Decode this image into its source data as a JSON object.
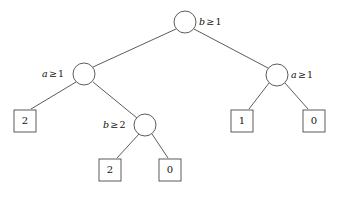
{
  "diagram": {
    "type": "decision-tree",
    "title": "",
    "stroke_color": "#4a4a4a",
    "text_color": "#111111",
    "background": "#ffffff",
    "nodes": [
      {
        "id": "root",
        "shape": "circle",
        "variable": "b",
        "operator": "≥",
        "threshold": "1",
        "label": "b ≥ 1",
        "label_side": "right",
        "cx": 185,
        "cy": 22,
        "r": 11
      },
      {
        "id": "left",
        "shape": "circle",
        "variable": "a",
        "operator": "≥",
        "threshold": "1",
        "label": "a ≥ 1",
        "label_side": "left",
        "cx": 84,
        "cy": 74,
        "r": 11
      },
      {
        "id": "right",
        "shape": "circle",
        "variable": "a",
        "operator": "≥",
        "threshold": "1",
        "label": "a ≥ 1",
        "label_side": "right",
        "cx": 277,
        "cy": 75,
        "r": 11
      },
      {
        "id": "mid",
        "shape": "circle",
        "variable": "b",
        "operator": "≥",
        "threshold": "2",
        "label": "b ≥ 2",
        "label_side": "left",
        "cx": 145,
        "cy": 125,
        "r": 11
      }
    ],
    "leaves": [
      {
        "id": "leaf-left",
        "value": "2",
        "x": 14,
        "y": 110,
        "size": 22
      },
      {
        "id": "leaf-mid-left",
        "value": "2",
        "x": 99,
        "y": 159,
        "size": 22
      },
      {
        "id": "leaf-mid-right",
        "value": "0",
        "x": 159,
        "y": 159,
        "size": 22
      },
      {
        "id": "leaf-right-left",
        "value": "1",
        "x": 231,
        "y": 110,
        "size": 22
      },
      {
        "id": "leaf-right-right",
        "value": "0",
        "x": 303,
        "y": 110,
        "size": 22
      }
    ],
    "edges": [
      {
        "from": "root",
        "to": "left"
      },
      {
        "from": "root",
        "to": "right"
      },
      {
        "from": "left",
        "to": "leaf-left"
      },
      {
        "from": "left",
        "to": "mid"
      },
      {
        "from": "mid",
        "to": "leaf-mid-left"
      },
      {
        "from": "mid",
        "to": "leaf-mid-right"
      },
      {
        "from": "right",
        "to": "leaf-right-left"
      },
      {
        "from": "right",
        "to": "leaf-right-right"
      }
    ]
  }
}
